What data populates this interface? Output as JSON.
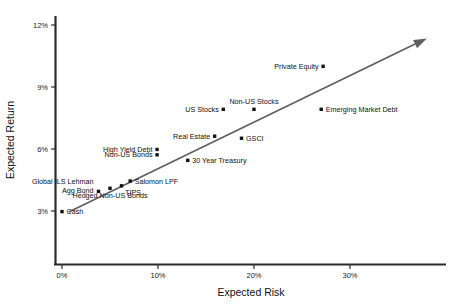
{
  "chart_data": {
    "type": "scatter",
    "title": "",
    "xlabel": "Expected Risk",
    "ylabel": "Expected Return",
    "xlim": [
      0,
      35
    ],
    "ylim": [
      1.5,
      12.6
    ],
    "grid": false,
    "legend": "none",
    "x_ticks": [
      "0%",
      "10%",
      "20%",
      "30%"
    ],
    "x_tick_values": [
      0,
      10,
      20,
      30
    ],
    "y_ticks": [
      "3%",
      "6%",
      "9%",
      "12%"
    ],
    "y_tick_values": [
      3,
      6,
      9,
      12
    ],
    "annotation": {
      "name": "efficient-frontier-arrow",
      "from": [
        0.7,
        2.95
      ],
      "to": [
        38.0,
        11.35
      ],
      "style": "arrow"
    },
    "points": [
      {
        "label": "Cash",
        "x": 0.0,
        "y": 2.97,
        "label_pos": "right"
      },
      {
        "label": "Global ILS Lehman Agg Bond",
        "x": 3.8,
        "y": 3.95,
        "label_pos": "above-left"
      },
      {
        "label": "Hedged Non-US Bonds",
        "x": 5.0,
        "y": 4.1,
        "label_pos": "below"
      },
      {
        "label": "TIPS",
        "x": 6.2,
        "y": 4.22,
        "label_pos": "below-right"
      },
      {
        "label": "Salomon LPF",
        "x": 7.1,
        "y": 4.45,
        "label_pos": "right"
      },
      {
        "label": "Non-US Bonds",
        "x": 9.9,
        "y": 5.72,
        "label_pos": "left"
      },
      {
        "label": "High Yield Debt",
        "x": 9.9,
        "y": 5.98,
        "label_pos": "left"
      },
      {
        "label": "30 Year Treasury",
        "x": 13.1,
        "y": 5.45,
        "label_pos": "right"
      },
      {
        "label": "Real Estate",
        "x": 15.9,
        "y": 6.62,
        "label_pos": "left"
      },
      {
        "label": "GSCI",
        "x": 18.7,
        "y": 6.52,
        "label_pos": "right"
      },
      {
        "label": "US Stocks",
        "x": 16.8,
        "y": 7.92,
        "label_pos": "left"
      },
      {
        "label": "Non-US Stocks",
        "x": 20.0,
        "y": 7.92,
        "label_pos": "above"
      },
      {
        "label": "Emerging Market Debt",
        "x": 27.0,
        "y": 7.92,
        "label_pos": "right"
      },
      {
        "label": "Private Equity",
        "x": 27.2,
        "y": 10.0,
        "label_pos": "left"
      }
    ]
  },
  "colors": {
    "marker": "#121212",
    "trend": "#5f5f63",
    "axis": "#2b2b2b",
    "text": "#111111",
    "background": "#ffffff"
  }
}
